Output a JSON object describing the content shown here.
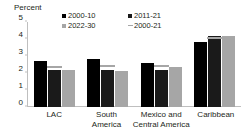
{
  "chart_data": {
    "type": "bar",
    "title": "",
    "subtitle": "",
    "xlabel": "",
    "ylabel": "Percent",
    "ylim": [
      0,
      5
    ],
    "yticks": [
      5,
      4,
      3,
      2,
      1,
      0
    ],
    "grid": false,
    "legend_position": "top",
    "categories": [
      {
        "lines": [
          "LAC"
        ]
      },
      {
        "lines": [
          "South",
          "America"
        ]
      },
      {
        "lines": [
          "Mexico and",
          "Central America"
        ]
      },
      {
        "lines": [
          "Caribbean"
        ]
      }
    ],
    "category_names": [
      "LAC",
      "South America",
      "Mexico and Central America",
      "Caribbean"
    ],
    "series": [
      {
        "name": "2000-10",
        "type": "bar",
        "color": "#000000",
        "values": [
          2.7,
          2.8,
          2.6,
          3.8
        ]
      },
      {
        "name": "2011-21",
        "type": "bar",
        "color": "#1a1a1a",
        "values": [
          2.15,
          2.2,
          2.15,
          4.15
        ]
      },
      {
        "name": "2022-30",
        "type": "bar",
        "color": "#a6a6a6",
        "values": [
          2.15,
          2.1,
          2.35,
          4.15
        ]
      },
      {
        "name": "2000-21",
        "type": "marker-line",
        "color": "#a6a6a6",
        "values": [
          2.35,
          2.4,
          2.4,
          4.05
        ]
      }
    ],
    "legend": [
      {
        "label": "2000-10",
        "marker": "square",
        "color": "#000000"
      },
      {
        "label": "2011-21",
        "marker": "square",
        "color": "#1a1a1a"
      },
      {
        "label": "2022-30",
        "marker": "square",
        "color": "#a6a6a6"
      },
      {
        "label": "2000-21",
        "marker": "line",
        "color": "#a6a6a6"
      }
    ]
  },
  "colors": {
    "axis": "#bfbfbf",
    "text": "#231f20",
    "background": "#ffffff"
  }
}
